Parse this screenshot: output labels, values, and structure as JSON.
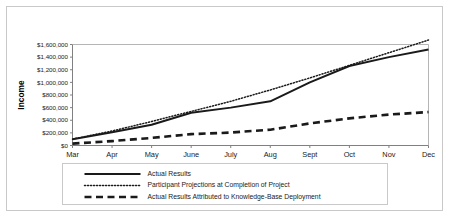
{
  "chart_data": {
    "type": "line",
    "title": "",
    "xlabel": "",
    "ylabel": "Income",
    "categories": [
      "Mar",
      "Apr",
      "May",
      "June",
      "July",
      "Aug",
      "Sept",
      "Oct",
      "Nov",
      "Dec"
    ],
    "ylim": [
      0,
      1600000
    ],
    "ytick_values": [
      0,
      200000,
      400000,
      600000,
      800000,
      1000000,
      1200000,
      1400000,
      1600000
    ],
    "ytick_labels": [
      "$0",
      "$200,000",
      "$400,000",
      "$600,000",
      "$800,000",
      "$1,000,000",
      "$1,200,000",
      "$1,400,000",
      "$1,600,000"
    ],
    "grid": false,
    "legend_position": "bottom",
    "series": [
      {
        "name": "Actual Results",
        "style": "solid",
        "color": "#1a1a1a",
        "values": [
          100000,
          210000,
          330000,
          520000,
          600000,
          700000,
          1000000,
          1260000,
          1400000,
          1520000
        ]
      },
      {
        "name": "Participant Projections at Completion of Project",
        "style": "dotted",
        "color": "#1a1a1a",
        "values": [
          100000,
          230000,
          380000,
          540000,
          700000,
          880000,
          1070000,
          1270000,
          1470000,
          1670000
        ]
      },
      {
        "name": "Actual Results Attributed to Knowledge-Base Deployment",
        "style": "dashed",
        "color": "#1a1a1a",
        "values": [
          30000,
          70000,
          120000,
          180000,
          205000,
          250000,
          350000,
          430000,
          490000,
          530000
        ]
      }
    ]
  },
  "axis": {
    "y_title": "Income"
  },
  "legend": {
    "items": [
      {
        "label": "Actual Results",
        "style": "solid"
      },
      {
        "label": "Participant Projections at Completion of Project",
        "style": "dotted"
      },
      {
        "label": "Actual Results Attributed to Knowledge-Base Deployment",
        "style": "dashed"
      }
    ]
  }
}
